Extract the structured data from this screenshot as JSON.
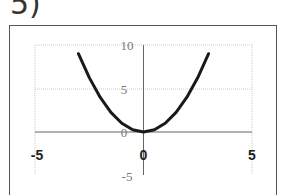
{
  "figure_label": "5)",
  "chart_data": {
    "type": "line",
    "title": "",
    "xlabel": "",
    "ylabel": "",
    "xlim": [
      -5,
      5
    ],
    "ylim": [
      -5,
      10
    ],
    "x_ticks": [
      "-5",
      "0",
      "5"
    ],
    "y_ticks": [
      "10",
      "5",
      "0",
      "-5"
    ],
    "grid": true,
    "legend": null,
    "series": [
      {
        "name": "f(x)",
        "x": [
          -3,
          -2.5,
          -2,
          -1.5,
          -1,
          -0.5,
          0,
          0.5,
          1,
          1.5,
          2,
          2.5,
          3
        ],
        "values": [
          9,
          6.25,
          4,
          2.25,
          1,
          0.25,
          0,
          0.25,
          1,
          2.25,
          4,
          6.25,
          9
        ]
      }
    ]
  },
  "labels": {
    "x_neg5": "-5",
    "x_0": "0",
    "x_5": "5",
    "y_10": "10",
    "y_5": "5",
    "y_0": "0",
    "y_neg5": "-5"
  }
}
